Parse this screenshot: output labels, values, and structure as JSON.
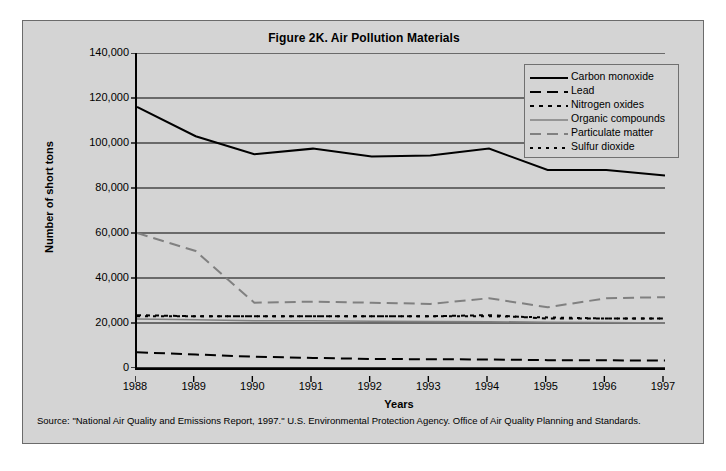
{
  "figure": {
    "title": "Figure 2K. Air Pollution Materials",
    "source_note": "Source: \"National Air Quality and Emissions Report, 1997.\" U.S. Environmental Protection Agency. Office of Air Quality Planning and Standards."
  },
  "chart_data": {
    "type": "line",
    "title": "Figure 2K. Air Pollution Materials",
    "xlabel": "Years",
    "ylabel": "Number of short tons",
    "x": [
      1988,
      1989,
      1990,
      1991,
      1992,
      1993,
      1994,
      1995,
      1996,
      1997
    ],
    "categories": [
      "1988",
      "1989",
      "1990",
      "1991",
      "1992",
      "1993",
      "1994",
      "1995",
      "1996",
      "1997"
    ],
    "ylim": [
      0,
      140000
    ],
    "yticks": [
      0,
      20000,
      40000,
      60000,
      80000,
      100000,
      120000,
      140000
    ],
    "ytick_labels": [
      "0",
      "20,000",
      "40,000",
      "60,000",
      "80,000",
      "100,000",
      "120,000",
      "140,000"
    ],
    "grid": true,
    "grid_axis": "y",
    "legend_position": "top-right",
    "series": [
      {
        "name": "Carbon monoxide",
        "style": "solid",
        "color": "#000000",
        "width": 2,
        "values": [
          116000,
          103000,
          95000,
          97500,
          94000,
          94500,
          97500,
          88000,
          88000,
          85500
        ]
      },
      {
        "name": "Lead",
        "style": "dashed",
        "color": "#000000",
        "width": 2,
        "values": [
          7000,
          6000,
          5000,
          4500,
          4000,
          3900,
          3800,
          3500,
          3400,
          3300
        ]
      },
      {
        "name": "Nitrogen oxides",
        "style": "dotted",
        "color": "#000000",
        "width": 2,
        "values": [
          23500,
          23000,
          23000,
          23000,
          23000,
          23000,
          23500,
          22000,
          22000,
          22000
        ]
      },
      {
        "name": "Organic compounds",
        "style": "solid",
        "color": "#808080",
        "width": 1.5,
        "values": [
          21800,
          21500,
          21000,
          21000,
          20800,
          20700,
          20600,
          20300,
          20200,
          20000
        ]
      },
      {
        "name": "Particulate matter",
        "style": "dashed",
        "color": "#808080",
        "width": 2,
        "values": [
          60000,
          52000,
          29000,
          29500,
          29000,
          28500,
          31000,
          27000,
          31000,
          31500
        ]
      },
      {
        "name": "Sulfur dioxide",
        "style": "dotted-fine",
        "color": "#000000",
        "width": 2,
        "values": [
          23000,
          23000,
          23000,
          23000,
          23000,
          23000,
          23000,
          22500,
          22000,
          22000
        ]
      }
    ]
  },
  "legend": {
    "items": [
      {
        "label": "Carbon monoxide"
      },
      {
        "label": "Lead"
      },
      {
        "label": "Nitrogen oxides"
      },
      {
        "label": "Organic compounds"
      },
      {
        "label": "Particulate matter"
      },
      {
        "label": "Sulfur dioxide"
      }
    ]
  }
}
